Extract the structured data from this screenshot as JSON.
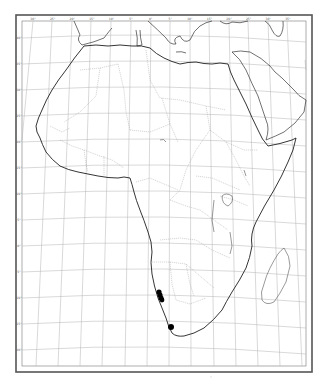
{
  "map": {
    "region": "Africa",
    "projection": "conic-like graticule",
    "frame": {
      "outer": [
        16,
        15,
        312,
        372
      ],
      "inner": [
        22,
        21,
        306,
        366
      ]
    },
    "colors": {
      "coast": "#222222",
      "border": "#9a9a9a",
      "grid": "#aaaaaa",
      "frame": "#555555",
      "dot": "#000000",
      "background": "#ffffff"
    },
    "top_ticks": [
      "30°",
      "25°",
      "20°",
      "15°",
      "10°",
      "5°",
      "0°",
      "5°",
      "10°",
      "15°",
      "20°",
      "25°",
      "30°",
      "35°",
      "40°",
      "45°",
      "50°",
      "55°"
    ],
    "left_ticks": [
      "40°",
      "35°",
      "30°",
      "25°",
      "20°",
      "15°",
      "10°",
      "5°",
      "0°",
      "5°",
      "10°",
      "15°",
      "20°",
      "25°",
      "30°",
      "35°",
      "40°"
    ],
    "occurrence_points": [
      {
        "x": 159,
        "y": 292,
        "r": 2.6
      },
      {
        "x": 160,
        "y": 295,
        "r": 2.6
      },
      {
        "x": 161,
        "y": 298,
        "r": 2.6
      },
      {
        "x": 162,
        "y": 300,
        "r": 2.4
      },
      {
        "x": 171,
        "y": 327,
        "r": 3.0
      }
    ],
    "footer_mark": "·"
  }
}
